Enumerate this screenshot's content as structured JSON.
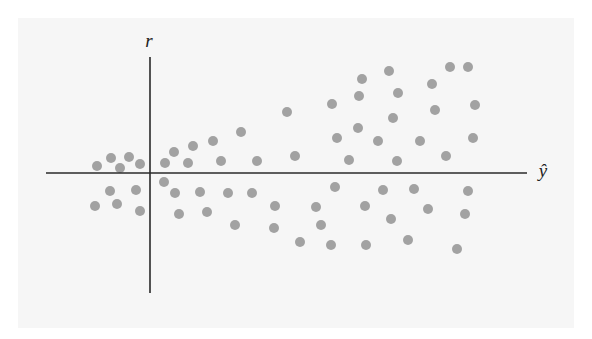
{
  "chart_data": {
    "type": "scatter",
    "title": "",
    "xlabel": "ŷ",
    "ylabel": "r",
    "grid": false,
    "legend": null,
    "axes": {
      "origin_px": [
        150,
        173
      ],
      "x_axis_px": {
        "start": 46,
        "end": 527,
        "y": 173
      },
      "y_axis_px": {
        "start": 57,
        "end": 293,
        "x": 150
      }
    },
    "note": "Residual plot (residuals r vs fitted ŷ) showing a fan/funnel shape: spread increases with ŷ. Coordinates are in pixel units relative to the axes origin (x right, y up).",
    "x": [
      -53,
      -39,
      -21,
      -30,
      -10,
      -40,
      -14,
      -55,
      -33,
      -10,
      15,
      24,
      43,
      38,
      63,
      91,
      71,
      107,
      137,
      145,
      182,
      212,
      239,
      209,
      248,
      208,
      187,
      228,
      199,
      247,
      243,
      282,
      300,
      318,
      325,
      285,
      270,
      323,
      296,
      14,
      25,
      50,
      78,
      102,
      29,
      57,
      85,
      125,
      124,
      150,
      185,
      233,
      166,
      215,
      171,
      241,
      181,
      216,
      258,
      264,
      318,
      278,
      315,
      307
    ],
    "y": [
      7,
      15,
      16,
      5,
      9,
      -18,
      -17,
      -33,
      -31,
      -38,
      10,
      21,
      27,
      10,
      32,
      41,
      12,
      12,
      61,
      17,
      69,
      94,
      102,
      77,
      80,
      45,
      35,
      32,
      13,
      12,
      55,
      89,
      106,
      106,
      68,
      63,
      32,
      35,
      17,
      -9,
      -20,
      -19,
      -20,
      -20,
      -41,
      -39,
      -52,
      -33,
      -55,
      -69,
      -14,
      -17,
      -34,
      -33,
      -52,
      -46,
      -72,
      -72,
      -67,
      -16,
      -18,
      -36,
      -41,
      -76
    ],
    "marker": {
      "color": "#a2a2a2",
      "radius_px": 5
    }
  },
  "colors": {
    "background": "#f6f6f6",
    "axis": "#2a2a2a",
    "point": "#a2a2a2"
  }
}
